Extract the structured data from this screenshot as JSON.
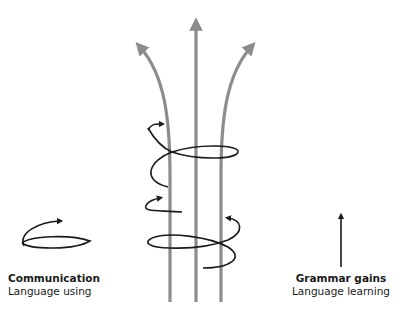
{
  "diagram": {
    "colors": {
      "strand": "#8c8c8c",
      "coil": "#1a1a1a",
      "text": "#1a1a1a"
    },
    "strands": [
      {
        "name": "left-strand",
        "direction": "up-left"
      },
      {
        "name": "center-strand",
        "direction": "up"
      },
      {
        "name": "right-strand",
        "direction": "up-right"
      }
    ],
    "coils": [
      {
        "name": "upper-coil",
        "arrow": "upper-left"
      },
      {
        "name": "lower-coil-left",
        "arrow": "upper-left"
      },
      {
        "name": "lower-coil-right",
        "arrow": "upper-left"
      }
    ],
    "legend": {
      "communication": {
        "title": "Communication",
        "subtitle": "Language using",
        "icon": "spiral-arrow-icon"
      },
      "grammar": {
        "title": "Grammar gains",
        "subtitle": "Language learning",
        "icon": "up-arrow-icon"
      }
    }
  }
}
